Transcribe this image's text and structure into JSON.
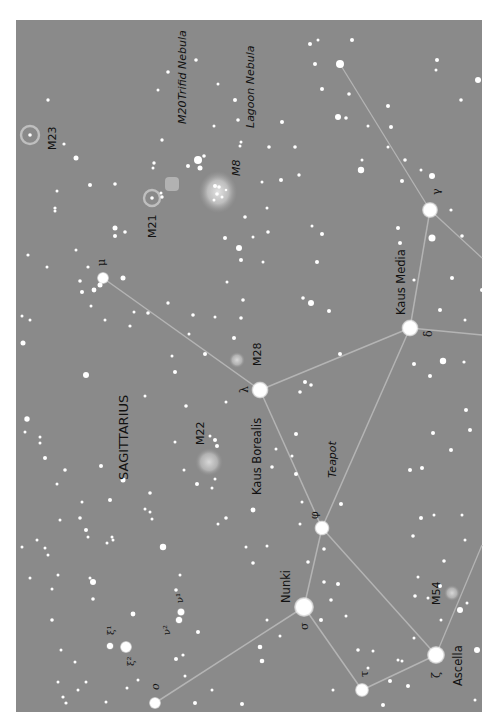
{
  "map": {
    "constellation": "SAGITTARIUS",
    "asterism": "Teapot",
    "colors": {
      "background": "#8a8a8a",
      "page": "#ffffff",
      "star": "#ffffff",
      "line": "#b4b4b4",
      "text": "#111111"
    },
    "named_stars": [
      {
        "id": "ascella",
        "name": "Ascella",
        "greek": "ζ",
        "x": 436,
        "y": 655,
        "r": 9
      },
      {
        "id": "tau",
        "name": "",
        "greek": "τ",
        "x": 362,
        "y": 690,
        "r": 7
      },
      {
        "id": "nunki",
        "name": "Nunki",
        "greek": "σ",
        "x": 304,
        "y": 607,
        "r": 10
      },
      {
        "id": "phi",
        "name": "",
        "greek": "φ",
        "x": 322,
        "y": 528,
        "r": 7.5
      },
      {
        "id": "kaus-borealis",
        "name": "Kaus Borealis",
        "greek": "λ",
        "x": 260,
        "y": 390,
        "r": 8.5
      },
      {
        "id": "kaus-media",
        "name": "Kaus Media",
        "greek": "δ",
        "x": 410,
        "y": 328,
        "r": 8.5
      },
      {
        "id": "gamma",
        "name": "",
        "greek": "γ",
        "x": 430,
        "y": 210,
        "r": 8
      },
      {
        "id": "mu",
        "name": "",
        "greek": "μ",
        "x": 103,
        "y": 278,
        "r": 6
      },
      {
        "id": "omicron",
        "name": "",
        "greek": "ο",
        "x": 155,
        "y": 703,
        "r": 6
      },
      {
        "id": "xi2",
        "name": "",
        "greek": "ξ²",
        "x": 126,
        "y": 647,
        "r": 6
      },
      {
        "id": "xi1",
        "name": "",
        "greek": "ξ¹",
        "x": 110,
        "y": 646,
        "r": 3.5
      },
      {
        "id": "nu1",
        "name": "",
        "greek": "ν¹",
        "x": 181,
        "y": 612,
        "r": 3.8
      },
      {
        "id": "nu2",
        "name": "",
        "greek": "ν²",
        "x": 179,
        "y": 620,
        "r": 3.5
      }
    ],
    "deep_sky": [
      {
        "id": "m8",
        "label": "M8",
        "sublabel": "Lagoon Nebula",
        "type": "nebula",
        "x": 218,
        "y": 192,
        "w": 38,
        "h": 42
      },
      {
        "id": "m20",
        "label": "M20",
        "sublabel": "Trifid Nebula",
        "type": "nebula-small",
        "x": 172,
        "y": 184,
        "w": 14,
        "h": 14
      },
      {
        "id": "m21",
        "label": "M21",
        "sublabel": "",
        "type": "open-cluster",
        "x": 152,
        "y": 198,
        "r": 8
      },
      {
        "id": "m23",
        "label": "M23",
        "sublabel": "",
        "type": "open-cluster",
        "x": 30,
        "y": 135,
        "r": 9
      },
      {
        "id": "m22",
        "label": "M22",
        "sublabel": "",
        "type": "globular",
        "x": 209,
        "y": 462,
        "r": 14
      },
      {
        "id": "m28",
        "label": "M28",
        "sublabel": "",
        "type": "globular",
        "x": 237,
        "y": 360,
        "r": 8
      },
      {
        "id": "m54",
        "label": "M54",
        "sublabel": "",
        "type": "globular",
        "x": 452,
        "y": 593,
        "r": 8
      }
    ],
    "lines": [
      [
        "ascella",
        "tau"
      ],
      [
        "tau",
        "nunki"
      ],
      [
        "nunki",
        "omicron"
      ],
      [
        "nunki",
        "phi"
      ],
      [
        "phi",
        "ascella"
      ],
      [
        "phi",
        "kaus-borealis"
      ],
      [
        "phi",
        "kaus-media"
      ],
      [
        "kaus-borealis",
        "kaus-media"
      ],
      [
        "kaus-borealis",
        "mu"
      ],
      [
        "kaus-media",
        "gamma"
      ]
    ],
    "edge_lines": [
      {
        "x1": 436,
        "y1": 655,
        "x2": 482,
        "y2": 545
      },
      {
        "x1": 410,
        "y1": 328,
        "x2": 482,
        "y2": 335
      },
      {
        "x1": 430,
        "y1": 210,
        "x2": 482,
        "y2": 258
      },
      {
        "x1": 430,
        "y1": 210,
        "x2": 340,
        "y2": 64
      }
    ],
    "field_stars": [
      [
        340,
        64,
        4
      ],
      [
        478,
        80,
        3
      ],
      [
        310,
        44,
        2
      ],
      [
        315,
        64,
        2
      ],
      [
        437,
        60,
        2
      ],
      [
        436,
        70,
        1.5
      ],
      [
        461,
        100,
        1.8
      ],
      [
        388,
        106,
        2
      ],
      [
        391,
        127,
        2
      ],
      [
        388,
        147,
        1.5
      ],
      [
        405,
        160,
        1.8
      ],
      [
        421,
        170,
        1.5
      ],
      [
        402,
        181,
        2
      ],
      [
        432,
        176,
        3
      ],
      [
        361,
        170,
        3.2
      ],
      [
        398,
        228,
        2
      ],
      [
        400,
        243,
        2
      ],
      [
        432,
        238,
        3.5
      ],
      [
        462,
        236,
        1.8
      ],
      [
        451,
        210,
        1.6
      ],
      [
        414,
        280,
        1.6
      ],
      [
        440,
        310,
        2
      ],
      [
        482,
        290,
        2
      ],
      [
        465,
        320,
        1.5
      ],
      [
        452,
        278,
        2
      ],
      [
        443,
        361,
        3.2
      ],
      [
        464,
        362,
        1.6
      ],
      [
        414,
        364,
        2
      ],
      [
        430,
        376,
        2
      ],
      [
        466,
        410,
        2
      ],
      [
        470,
        430,
        2
      ],
      [
        433,
        433,
        2
      ],
      [
        451,
        450,
        2
      ],
      [
        422,
        468,
        2
      ],
      [
        410,
        470,
        2
      ],
      [
        434,
        515,
        1.5
      ],
      [
        421,
        518,
        2
      ],
      [
        413,
        536,
        1.8
      ],
      [
        462,
        515,
        1.5
      ],
      [
        465,
        540,
        1.5
      ],
      [
        444,
        561,
        1.8
      ],
      [
        440,
        586,
        2
      ],
      [
        467,
        603,
        1.5
      ],
      [
        460,
        610,
        3
      ],
      [
        477,
        650,
        3
      ],
      [
        475,
        700,
        1.5
      ],
      [
        408,
        686,
        2
      ],
      [
        398,
        660,
        1.5
      ],
      [
        383,
        705,
        2
      ],
      [
        333,
        690,
        1.5
      ],
      [
        321,
        620,
        2
      ],
      [
        331,
        600,
        1.8
      ],
      [
        338,
        584,
        2
      ],
      [
        308,
        562,
        1.8
      ],
      [
        341,
        504,
        2
      ],
      [
        302,
        502,
        1.5
      ],
      [
        300,
        524,
        1.5
      ],
      [
        292,
        456,
        1.5
      ],
      [
        296,
        474,
        2
      ],
      [
        296,
        434,
        2
      ],
      [
        305,
        382,
        2
      ],
      [
        311,
        385,
        1.8
      ],
      [
        300,
        392,
        1.8
      ],
      [
        340,
        354,
        2
      ],
      [
        329,
        311,
        2
      ],
      [
        311,
        303,
        3
      ],
      [
        303,
        298,
        1.8
      ],
      [
        317,
        262,
        2
      ],
      [
        322,
        234,
        2
      ],
      [
        312,
        226,
        1.5
      ],
      [
        299,
        175,
        1.7
      ],
      [
        295,
        147,
        1.8
      ],
      [
        269,
        147,
        1.8
      ],
      [
        262,
        182,
        1.5
      ],
      [
        240,
        146,
        1.5
      ],
      [
        241,
        142,
        1.5
      ],
      [
        282,
        122,
        2
      ],
      [
        281,
        180,
        2
      ],
      [
        322,
        89,
        2
      ],
      [
        338,
        117,
        3
      ],
      [
        349,
        94,
        1.8
      ],
      [
        346,
        118,
        1.8
      ],
      [
        368,
        126,
        1.5
      ],
      [
        362,
        160,
        1.5
      ],
      [
        352,
        40,
        2
      ],
      [
        318,
        40,
        1.5
      ],
      [
        263,
        262,
        1.5
      ],
      [
        241,
        260,
        2
      ],
      [
        267,
        208,
        1.5
      ],
      [
        245,
        217,
        1.8
      ],
      [
        227,
        282,
        1.5
      ],
      [
        243,
        300,
        1.8
      ],
      [
        241,
        318,
        1.8
      ],
      [
        225,
        238,
        2
      ],
      [
        198,
        160,
        4
      ],
      [
        204,
        156,
        1.8
      ],
      [
        200,
        168,
        2.5
      ],
      [
        188,
        166,
        2
      ],
      [
        214,
        126,
        1.5
      ],
      [
        238,
        120,
        1.8
      ],
      [
        235,
        100,
        2
      ],
      [
        218,
        84,
        1.5
      ],
      [
        196,
        60,
        1.8
      ],
      [
        168,
        72,
        1.8
      ],
      [
        158,
        90,
        1.5
      ],
      [
        162,
        140,
        1.7
      ],
      [
        153,
        168,
        1.5
      ],
      [
        154,
        163,
        1.7
      ],
      [
        161,
        193,
        1.5
      ],
      [
        162,
        197,
        1.7
      ],
      [
        115,
        228,
        2.5
      ],
      [
        115,
        236,
        2
      ],
      [
        100,
        285,
        2.5
      ],
      [
        94,
        290,
        2.4
      ],
      [
        82,
        292,
        2
      ],
      [
        105,
        320,
        1.5
      ],
      [
        91,
        306,
        1.5
      ],
      [
        80,
        281,
        1.8
      ],
      [
        88,
        267,
        1.6
      ],
      [
        123,
        278,
        2.5
      ],
      [
        125,
        232,
        1.8
      ],
      [
        115,
        184,
        1.8
      ],
      [
        90,
        185,
        2
      ],
      [
        76,
        158,
        2.5
      ],
      [
        64,
        144,
        1.6
      ],
      [
        55,
        208,
        1.6
      ],
      [
        57,
        191,
        1.5
      ],
      [
        48,
        100,
        1.7
      ],
      [
        55,
        211,
        1.5
      ],
      [
        76,
        250,
        1.5
      ],
      [
        47,
        267,
        1.5
      ],
      [
        28,
        255,
        1.6
      ],
      [
        22,
        316,
        1.5
      ],
      [
        23,
        343,
        2.5
      ],
      [
        30,
        320,
        1.5
      ],
      [
        86,
        375,
        3
      ],
      [
        27,
        419,
        2.7
      ],
      [
        25,
        432,
        1.5
      ],
      [
        40,
        437,
        1.5
      ],
      [
        40,
        443,
        1.5
      ],
      [
        45,
        458,
        2
      ],
      [
        57,
        484,
        1.5
      ],
      [
        65,
        470,
        1.8
      ],
      [
        101,
        466,
        2
      ],
      [
        110,
        500,
        2
      ],
      [
        123,
        480,
        2.5
      ],
      [
        82,
        502,
        1.5
      ],
      [
        60,
        520,
        1.5
      ],
      [
        80,
        518,
        1.8
      ],
      [
        86,
        530,
        2
      ],
      [
        58,
        575,
        1.5
      ],
      [
        48,
        555,
        1.5
      ],
      [
        37,
        540,
        1.5
      ],
      [
        22,
        547,
        1.5
      ],
      [
        30,
        578,
        1.5
      ],
      [
        45,
        548,
        1.5
      ],
      [
        88,
        537,
        1.5
      ],
      [
        107,
        543,
        1.5
      ],
      [
        113,
        540,
        1.5
      ],
      [
        112,
        537,
        1.5
      ],
      [
        145,
        509,
        1.5
      ],
      [
        150,
        493,
        1.8
      ],
      [
        163,
        547,
        3.2
      ],
      [
        150,
        512,
        1.5
      ],
      [
        152,
        519,
        1.5
      ],
      [
        180,
        575,
        1.5
      ],
      [
        176,
        590,
        1.8
      ],
      [
        90,
        578,
        1.5
      ],
      [
        93,
        582,
        3
      ],
      [
        93,
        599,
        1.8
      ],
      [
        52,
        589,
        1.5
      ],
      [
        52,
        620,
        1.8
      ],
      [
        133,
        614,
        2.4
      ],
      [
        198,
        632,
        2
      ],
      [
        183,
        655,
        1.6
      ],
      [
        61,
        650,
        1.5
      ],
      [
        58,
        682,
        1.5
      ],
      [
        75,
        662,
        1.5
      ],
      [
        78,
        690,
        1.5
      ],
      [
        86,
        682,
        1.5
      ],
      [
        63,
        697,
        1.6
      ],
      [
        66,
        703,
        1.6
      ],
      [
        106,
        702,
        1.5
      ],
      [
        127,
        688,
        1.5
      ],
      [
        138,
        680,
        1.5
      ],
      [
        176,
        659,
        2
      ],
      [
        185,
        676,
        1.5
      ],
      [
        195,
        703,
        2
      ],
      [
        212,
        690,
        1.5
      ],
      [
        242,
        704,
        2
      ],
      [
        262,
        661,
        2.3
      ],
      [
        260,
        647,
        2.3
      ],
      [
        267,
        620,
        1.5
      ],
      [
        280,
        636,
        1.5
      ],
      [
        186,
        406,
        1.8
      ],
      [
        215,
        440,
        2
      ],
      [
        217,
        446,
        2
      ],
      [
        210,
        436,
        1.5
      ],
      [
        197,
        484,
        2
      ],
      [
        184,
        470,
        1.5
      ],
      [
        175,
        442,
        1.5
      ],
      [
        145,
        396,
        1.5
      ],
      [
        168,
        303,
        1.7
      ],
      [
        130,
        326,
        1.6
      ],
      [
        134,
        312,
        1.5
      ],
      [
        148,
        313,
        1.8
      ],
      [
        175,
        372,
        2
      ],
      [
        172,
        356,
        1.5
      ],
      [
        189,
        334,
        1.5
      ],
      [
        193,
        315,
        1.8
      ],
      [
        215,
        317,
        1.5
      ],
      [
        205,
        354,
        2
      ],
      [
        226,
        402,
        1.5
      ],
      [
        234,
        338,
        2
      ],
      [
        239,
        248,
        3
      ],
      [
        253,
        237,
        1.5
      ],
      [
        268,
        232,
        1.8
      ],
      [
        253,
        510,
        2.4
      ],
      [
        272,
        467,
        1.8
      ],
      [
        276,
        449,
        1.5
      ],
      [
        215,
        479,
        1.5
      ],
      [
        212,
        488,
        1.5
      ],
      [
        226,
        518,
        1.8
      ],
      [
        218,
        524,
        1.5
      ],
      [
        246,
        547,
        1.5
      ],
      [
        267,
        546,
        1.5
      ],
      [
        253,
        563,
        1.8
      ],
      [
        324,
        549,
        1.8
      ],
      [
        324,
        582,
        1.8
      ],
      [
        346,
        616,
        1.5
      ],
      [
        358,
        650,
        1.8
      ],
      [
        373,
        651,
        1.5
      ],
      [
        368,
        668,
        1.5
      ],
      [
        390,
        681,
        2
      ],
      [
        402,
        661,
        1.5
      ],
      [
        414,
        638,
        1.5
      ],
      [
        441,
        620,
        1.5
      ],
      [
        415,
        596,
        1.8
      ],
      [
        428,
        598,
        1.5
      ],
      [
        418,
        577,
        1.5
      ]
    ]
  }
}
